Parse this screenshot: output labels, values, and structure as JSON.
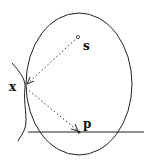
{
  "diagram": {
    "labels": {
      "source": "s",
      "surface_point": "x",
      "receiver": "p"
    },
    "colors": {
      "stroke": "#222222",
      "background": "#ffffff"
    }
  }
}
